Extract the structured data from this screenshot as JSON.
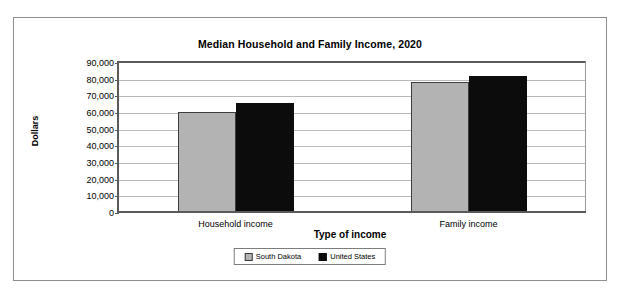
{
  "chart_data": {
    "type": "bar",
    "title": "Median Household and Family Income, 2020",
    "xlabel": "Type of income",
    "ylabel": "Dollars",
    "categories": [
      "Household income",
      "Family income"
    ],
    "series": [
      {
        "name": "South Dakota",
        "color": "#b3b3b3",
        "values": [
          59500,
          77500
        ]
      },
      {
        "name": "United States",
        "color": "#0c0c0c",
        "values": [
          65000,
          81000
        ]
      }
    ],
    "ylim": [
      0,
      90000
    ],
    "ytick_step": 10000,
    "yticks": [
      "90,000",
      "80,000",
      "70,000",
      "60,000",
      "50,000",
      "40,000",
      "30,000",
      "20,000",
      "10,000",
      "0"
    ],
    "grid": true,
    "legend_position": "bottom"
  },
  "legend": {
    "items": [
      {
        "label": "South Dakota"
      },
      {
        "label": "United States"
      }
    ]
  }
}
